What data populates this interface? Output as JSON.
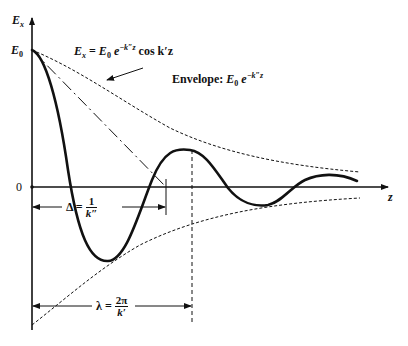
{
  "figure": {
    "y_axis_label": "E",
    "y_axis_label_sub": "x",
    "x_axis_label": "z",
    "e0_tick_label": "E",
    "e0_tick_sub": "0",
    "zero_tick_label": "0",
    "equation": {
      "lhs": "E",
      "lhs_sub": "x",
      "eq": " = ",
      "e0": "E",
      "e0_sub": "0",
      "exp_base": " e",
      "exp": "−k″z",
      "tail": " cos k′z"
    },
    "envelope_label": {
      "text": "Envelope: ",
      "e0": "E",
      "e0_sub": "0",
      "exp_base": " e",
      "exp": "−k″z"
    },
    "delta_label": {
      "lhs": "Δ = ",
      "num": "1",
      "den": "k″"
    },
    "lambda_label": {
      "lhs": "λ = ",
      "num": "2π",
      "den": "k′"
    },
    "colors": {
      "ink": "#111111",
      "background": "#ffffff"
    }
  }
}
